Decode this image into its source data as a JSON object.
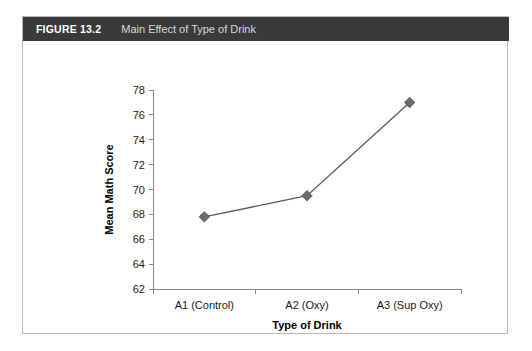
{
  "figure": {
    "number_label": "FIGURE 13.2",
    "caption": "Main Effect of Type of Drink",
    "header_bg": "#3a3a3a",
    "border_color": "#b9b9b9"
  },
  "chart_data": {
    "type": "line",
    "title": "",
    "xlabel": "Type of Drink",
    "ylabel": "Mean Math Score",
    "categories": [
      "A1 (Control)",
      "A2 (Oxy)",
      "A3 (Sup Oxy)"
    ],
    "values": [
      67.8,
      69.5,
      77.0
    ],
    "series": [
      {
        "name": "Mean Math Score",
        "values": [
          67.8,
          69.5,
          77.0
        ]
      }
    ],
    "ylim": [
      62,
      78
    ],
    "yticks": [
      62,
      64,
      66,
      68,
      70,
      72,
      74,
      76,
      78
    ],
    "ytick_labels": [
      "62",
      "64",
      "66",
      "68",
      "70",
      "72",
      "74",
      "76",
      "78"
    ],
    "grid": false,
    "legend": "none",
    "marker": "diamond",
    "marker_color": "#6b6b6b",
    "line_color": "#595959",
    "axis_color": "#8a8a8a"
  }
}
